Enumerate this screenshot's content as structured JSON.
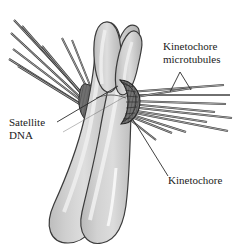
{
  "figure": {
    "background_color": "#ffffff"
  },
  "labels": {
    "kinetochore_microtubules_line1": "Kinetochore",
    "kinetochore_microtubules_line2": "microtubules",
    "satellite_dna_line1": "Satellite",
    "satellite_dna_line2": "DNA",
    "kinetochore": "Kinetochore"
  },
  "colors": {
    "chromatid_fill": "#c9c9c9",
    "chromatid_highlight": "#e6e6e6",
    "chromatid_outline": "#3b3b3b",
    "kinetochore_fill": "#6e6e6e",
    "kinetochore_dark": "#4a4a4a",
    "kinetochore_outline": "#2b2b2b",
    "microtubule_stroke": "#707070",
    "microtubule_edge": "#3a3a3a",
    "leader_line": "#2b2b2b",
    "text": "#1a1a1a"
  },
  "structures": {
    "chromatid_left_name": "sister chromatid left",
    "chromatid_right_name": "sister chromatid right",
    "short_arm_left_name": "short arm left",
    "short_arm_right_name": "short arm right",
    "kinetochore_left_name": "kinetochore left plate",
    "kinetochore_right_name": "kinetochore right plate",
    "centromere_name": "centromere constriction"
  },
  "counts": {
    "microtubules_left": 8,
    "microtubules_right": 11
  }
}
